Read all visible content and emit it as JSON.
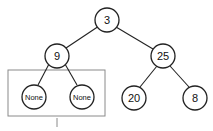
{
  "diagram": {
    "type": "binary-tree",
    "nodes": [
      {
        "id": "n3",
        "label": "3"
      },
      {
        "id": "n9",
        "label": "9"
      },
      {
        "id": "n25",
        "label": "25"
      },
      {
        "id": "nNoneL",
        "label": "None"
      },
      {
        "id": "nNoneR",
        "label": "None"
      },
      {
        "id": "n20",
        "label": "20"
      },
      {
        "id": "n8",
        "label": "8"
      }
    ],
    "edges": [
      [
        "n3",
        "n9"
      ],
      [
        "n3",
        "n25"
      ],
      [
        "n9",
        "nNoneL"
      ],
      [
        "n9",
        "nNoneR"
      ],
      [
        "n25",
        "n20"
      ],
      [
        "n25",
        "n8"
      ]
    ],
    "highlight_box": "children of 9 (None, None)"
  },
  "colors": {
    "stroke": "#222222",
    "box": "#888888"
  }
}
